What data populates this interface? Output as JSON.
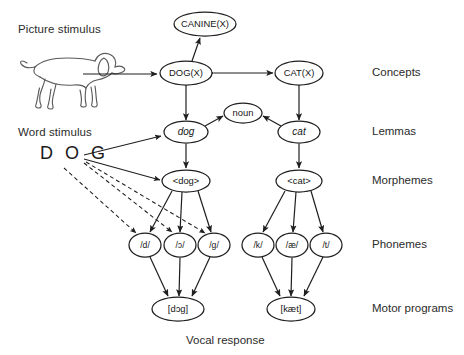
{
  "diagram": {
    "stimuli": {
      "picture_label": "Picture stimulus",
      "picture_icon": "dog-line-drawing",
      "word_label": "Word stimulus",
      "word_value": "D O G"
    },
    "row_labels": [
      {
        "id": "concepts",
        "text": "Concepts",
        "y": 73
      },
      {
        "id": "lemmas",
        "text": "Lemmas",
        "y": 132
      },
      {
        "id": "morphemes",
        "text": "Morphemes",
        "y": 181
      },
      {
        "id": "phonemes",
        "text": "Phonemes",
        "y": 245
      },
      {
        "id": "motor-programs",
        "text": "Motor programs",
        "y": 309
      }
    ],
    "bottom_caption": "Vocal response",
    "nodes": [
      {
        "id": "canine-x",
        "label": "CANINE(X)",
        "x": 205,
        "y": 24,
        "rx": 31,
        "ry": 12,
        "style": "plain"
      },
      {
        "id": "dog-x",
        "label": "DOG(X)",
        "x": 186,
        "y": 73,
        "rx": 26,
        "ry": 12,
        "style": "plain"
      },
      {
        "id": "cat-x",
        "label": "CAT(X)",
        "x": 299,
        "y": 73,
        "rx": 24,
        "ry": 12,
        "style": "plain"
      },
      {
        "id": "noun",
        "label": "noun",
        "x": 243,
        "y": 113,
        "rx": 19,
        "ry": 10,
        "style": "plain"
      },
      {
        "id": "lemma-dog",
        "label": "dog",
        "x": 186,
        "y": 132,
        "rx": 22,
        "ry": 11,
        "style": "italic"
      },
      {
        "id": "lemma-cat",
        "label": "cat",
        "x": 299,
        "y": 132,
        "rx": 21,
        "ry": 11,
        "style": "italic"
      },
      {
        "id": "morph-dog",
        "label": "<dog>",
        "x": 186,
        "y": 181,
        "rx": 24,
        "ry": 11,
        "style": "plain"
      },
      {
        "id": "morph-cat",
        "label": "<cat>",
        "x": 299,
        "y": 181,
        "rx": 23,
        "ry": 11,
        "style": "plain"
      },
      {
        "id": "phon-d",
        "label": "/d/",
        "x": 145,
        "y": 245,
        "rx": 16,
        "ry": 12,
        "style": "small"
      },
      {
        "id": "phon-open-o",
        "label": "/ɔ/",
        "x": 180,
        "y": 245,
        "rx": 16,
        "ry": 12,
        "style": "small"
      },
      {
        "id": "phon-g",
        "label": "/g/",
        "x": 214,
        "y": 245,
        "rx": 16,
        "ry": 12,
        "style": "small"
      },
      {
        "id": "phon-k",
        "label": "/k/",
        "x": 258,
        "y": 245,
        "rx": 16,
        "ry": 12,
        "style": "small"
      },
      {
        "id": "phon-ae",
        "label": "/æ/",
        "x": 292,
        "y": 245,
        "rx": 16,
        "ry": 12,
        "style": "small"
      },
      {
        "id": "phon-t",
        "label": "/t/",
        "x": 326,
        "y": 245,
        "rx": 16,
        "ry": 12,
        "style": "small"
      },
      {
        "id": "motor-dog",
        "label": "[dɔg]",
        "x": 178,
        "y": 309,
        "rx": 26,
        "ry": 12,
        "style": "plain"
      },
      {
        "id": "motor-cat",
        "label": "[kæt]",
        "x": 291,
        "y": 309,
        "rx": 24,
        "ry": 12,
        "style": "plain"
      }
    ],
    "edges": [
      {
        "id": "picture-to-dogx",
        "from": "picture-stimulus",
        "to": "dog-x",
        "type": "solid",
        "heads": "end"
      },
      {
        "id": "dogx-canine",
        "from": "dog-x",
        "to": "canine-x",
        "type": "solid",
        "heads": "both"
      },
      {
        "id": "dogx-catx",
        "from": "dog-x",
        "to": "cat-x",
        "type": "solid",
        "heads": "both"
      },
      {
        "id": "dogx-lemma-dog",
        "from": "dog-x",
        "to": "lemma-dog",
        "type": "solid",
        "heads": "both"
      },
      {
        "id": "catx-lemma-cat",
        "from": "cat-x",
        "to": "lemma-cat",
        "type": "solid",
        "heads": "both"
      },
      {
        "id": "lemma-dog-noun",
        "from": "lemma-dog",
        "to": "noun",
        "type": "solid",
        "heads": "end"
      },
      {
        "id": "lemma-cat-noun",
        "from": "lemma-cat",
        "to": "noun",
        "type": "solid",
        "heads": "end"
      },
      {
        "id": "lemma-dog-morph",
        "from": "lemma-dog",
        "to": "morph-dog",
        "type": "solid",
        "heads": "end"
      },
      {
        "id": "lemma-cat-morph",
        "from": "lemma-cat",
        "to": "morph-cat",
        "type": "solid",
        "heads": "end"
      },
      {
        "id": "word-to-lemma-dog",
        "from": "word-stimulus",
        "to": "lemma-dog",
        "type": "solid",
        "heads": "end"
      },
      {
        "id": "word-to-morph-dog",
        "from": "word-stimulus",
        "to": "morph-dog",
        "type": "solid",
        "heads": "end"
      },
      {
        "id": "word-to-phon-d",
        "from": "word-stimulus",
        "to": "phon-d",
        "type": "dashed",
        "heads": "end"
      },
      {
        "id": "word-to-phon-o",
        "from": "word-stimulus",
        "to": "phon-open-o",
        "type": "dashed",
        "heads": "end"
      },
      {
        "id": "word-to-phon-g",
        "from": "word-stimulus",
        "to": "phon-g",
        "type": "dashed",
        "heads": "end"
      },
      {
        "id": "morph-dog-phon-d",
        "from": "morph-dog",
        "to": "phon-d",
        "type": "solid",
        "heads": "end"
      },
      {
        "id": "morph-dog-phon-o",
        "from": "morph-dog",
        "to": "phon-open-o",
        "type": "solid",
        "heads": "end"
      },
      {
        "id": "morph-dog-phon-g",
        "from": "morph-dog",
        "to": "phon-g",
        "type": "solid",
        "heads": "end"
      },
      {
        "id": "morph-cat-phon-k",
        "from": "morph-cat",
        "to": "phon-k",
        "type": "solid",
        "heads": "end"
      },
      {
        "id": "morph-cat-phon-ae",
        "from": "morph-cat",
        "to": "phon-ae",
        "type": "solid",
        "heads": "end"
      },
      {
        "id": "morph-cat-phon-t",
        "from": "morph-cat",
        "to": "phon-t",
        "type": "solid",
        "heads": "end"
      },
      {
        "id": "phon-d-motor",
        "from": "phon-d",
        "to": "motor-dog",
        "type": "solid",
        "heads": "end"
      },
      {
        "id": "phon-o-motor",
        "from": "phon-open-o",
        "to": "motor-dog",
        "type": "solid",
        "heads": "end"
      },
      {
        "id": "phon-g-motor",
        "from": "phon-g",
        "to": "motor-dog",
        "type": "solid",
        "heads": "end"
      },
      {
        "id": "phon-k-motor",
        "from": "phon-k",
        "to": "motor-cat",
        "type": "solid",
        "heads": "end"
      },
      {
        "id": "phon-ae-motor",
        "from": "phon-ae",
        "to": "motor-cat",
        "type": "solid",
        "heads": "end"
      },
      {
        "id": "phon-t-motor",
        "from": "phon-t",
        "to": "motor-cat",
        "type": "solid",
        "heads": "end"
      }
    ],
    "colors": {
      "stroke": "#1f1f1f",
      "text": "#2b2b2b",
      "background": "#ffffff",
      "picture_stroke": "#5a5a5a"
    }
  }
}
